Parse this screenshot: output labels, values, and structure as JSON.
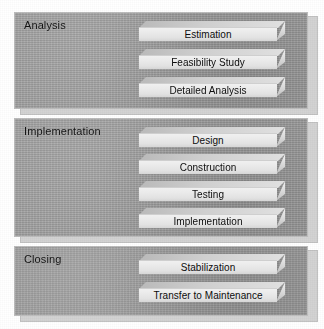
{
  "diagram": {
    "type": "phase-stack",
    "colors": {
      "panel_background": "#9e9e9e",
      "panel_border": "#bdbdbd",
      "shadow_plate": "#d3d3d3",
      "block_face": "#eaeaea",
      "block_top": "#cfcfcf",
      "block_side": "#d2d2d2",
      "text": "#111111",
      "page_background": "#ffffff"
    },
    "phases": [
      {
        "name": "analysis",
        "title": "Analysis",
        "blocks": [
          {
            "name": "estimation",
            "label": "Estimation"
          },
          {
            "name": "feasibility-study",
            "label": "Feasibility Study"
          },
          {
            "name": "detailed-analysis",
            "label": "Detailed Analysis"
          }
        ]
      },
      {
        "name": "implementation",
        "title": "Implementation",
        "blocks": [
          {
            "name": "design",
            "label": "Design"
          },
          {
            "name": "construction",
            "label": "Construction"
          },
          {
            "name": "testing",
            "label": "Testing"
          },
          {
            "name": "implementation",
            "label": "Implementation"
          }
        ]
      },
      {
        "name": "closing",
        "title": "Closing",
        "blocks": [
          {
            "name": "stabilization",
            "label": "Stabilization"
          },
          {
            "name": "transfer-to-maintenance",
            "label": "Transfer to Maintenance"
          }
        ]
      }
    ]
  }
}
